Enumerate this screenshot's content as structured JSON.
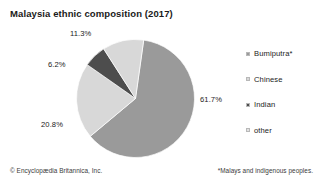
{
  "chart_data": {
    "type": "pie",
    "title": "Malaysia ethnic composition (2017)",
    "categories": [
      "Bumiputra*",
      "Chinese",
      "Indian",
      "other"
    ],
    "values": [
      61.7,
      20.8,
      6.2,
      11.3
    ],
    "value_labels": [
      "61.7%",
      "20.8%",
      "6.2%",
      "11.3%"
    ],
    "unit": "percent",
    "total": 100.0,
    "colors": [
      "#9a9a9a",
      "#d8d8d8",
      "#4d4d4d",
      "#d8d8d8"
    ],
    "legend_position": "right",
    "grid": false,
    "xlabel": "",
    "ylabel": "",
    "start_angle_deg": 8,
    "direction": "clockwise",
    "slices": [
      {
        "label": "Bumiputra*",
        "value": 61.7,
        "value_label": "61.7%",
        "color": "#9a9a9a"
      },
      {
        "label": "Chinese",
        "value": 20.8,
        "value_label": "20.8%",
        "color": "#d8d8d8"
      },
      {
        "label": "Indian",
        "value": 6.2,
        "value_label": "6.2%",
        "color": "#4d4d4d"
      },
      {
        "label": "other",
        "value": 11.3,
        "value_label": "11.3%",
        "color": "#d8d8d8"
      }
    ]
  },
  "header": {
    "title": "Malaysia ethnic composition (2017)"
  },
  "legend": {
    "items": [
      {
        "label": "Bumiputra*",
        "color": "#9a9a9a"
      },
      {
        "label": "Chinese",
        "color": "#d8d8d8"
      },
      {
        "label": "Indian",
        "color": "#4d4d4d"
      },
      {
        "label": "other",
        "color": "#e2e2e2"
      }
    ]
  },
  "labels": {
    "bumiputra": "61.7%",
    "chinese": "20.8%",
    "indian": "6.2%",
    "other": "11.3%"
  },
  "footer": {
    "credit": "© Encyclopædia Britannica, Inc.",
    "footnote": "*Malays and indigenous peoples."
  },
  "colors": {
    "bumiputra": "#9a9a9a",
    "chinese": "#d8d8d8",
    "indian": "#4d4d4d",
    "other": "#e2e2e2",
    "text": "#1a1a1a",
    "background": "#ffffff"
  }
}
